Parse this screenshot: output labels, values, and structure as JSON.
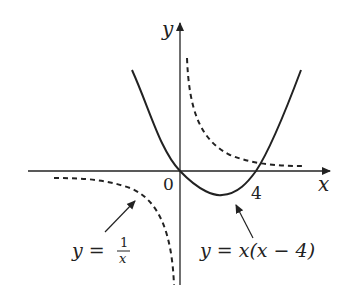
{
  "diagram": {
    "axes": {
      "x_label": "x",
      "y_label": "y",
      "origin_label": "0",
      "tick_labels": [
        "4"
      ]
    },
    "curves": [
      {
        "name": "parabola",
        "equation": "y = x(x − 4)",
        "style": "solid",
        "roots": [
          0,
          4
        ],
        "vertex": [
          2,
          -4
        ]
      },
      {
        "name": "hyperbola",
        "equation": "y = 1/x",
        "style": "dashed"
      }
    ],
    "labels": {
      "hyperbola_lhs": "y =",
      "hyperbola_num": "1",
      "hyperbola_den": "x",
      "parabola_eq": "y = x(x − 4)"
    },
    "colors": {
      "ink": "#222222",
      "background": "#ffffff"
    }
  }
}
